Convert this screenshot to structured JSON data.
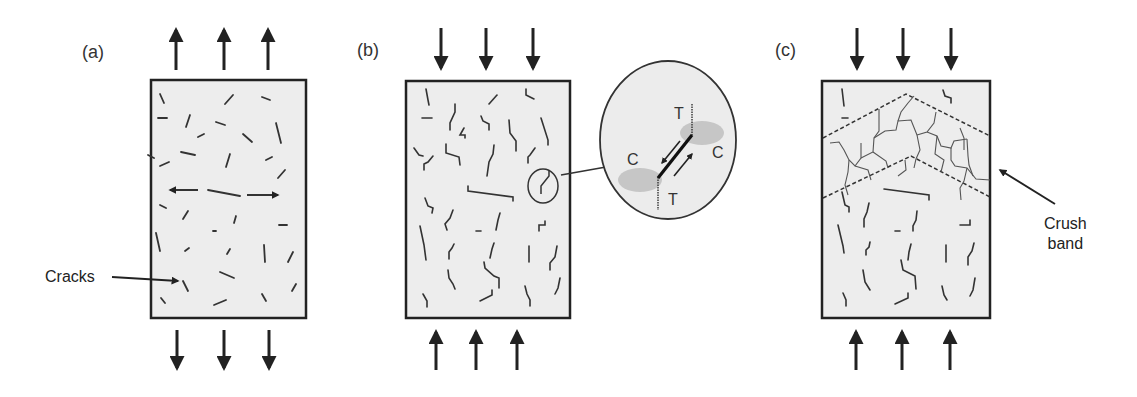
{
  "panels": [
    {
      "id": "a",
      "label": "(a)",
      "loading": "tension",
      "annotation": "Cracks"
    },
    {
      "id": "b",
      "label": "(b)",
      "loading": "compression",
      "magnifier_labels": {
        "tension_top": "T",
        "tension_bottom": "T",
        "compression_left": "C",
        "compression_right": "C"
      }
    },
    {
      "id": "c",
      "label": "(c)",
      "loading": "compression",
      "annotation_line1": "Crush",
      "annotation_line2": "band"
    }
  ],
  "colors": {
    "specimen_fill": "#ededed",
    "outline": "#222222",
    "crack": "#333333",
    "compression_zone": "#c8c8c8",
    "background": "#ffffff"
  }
}
